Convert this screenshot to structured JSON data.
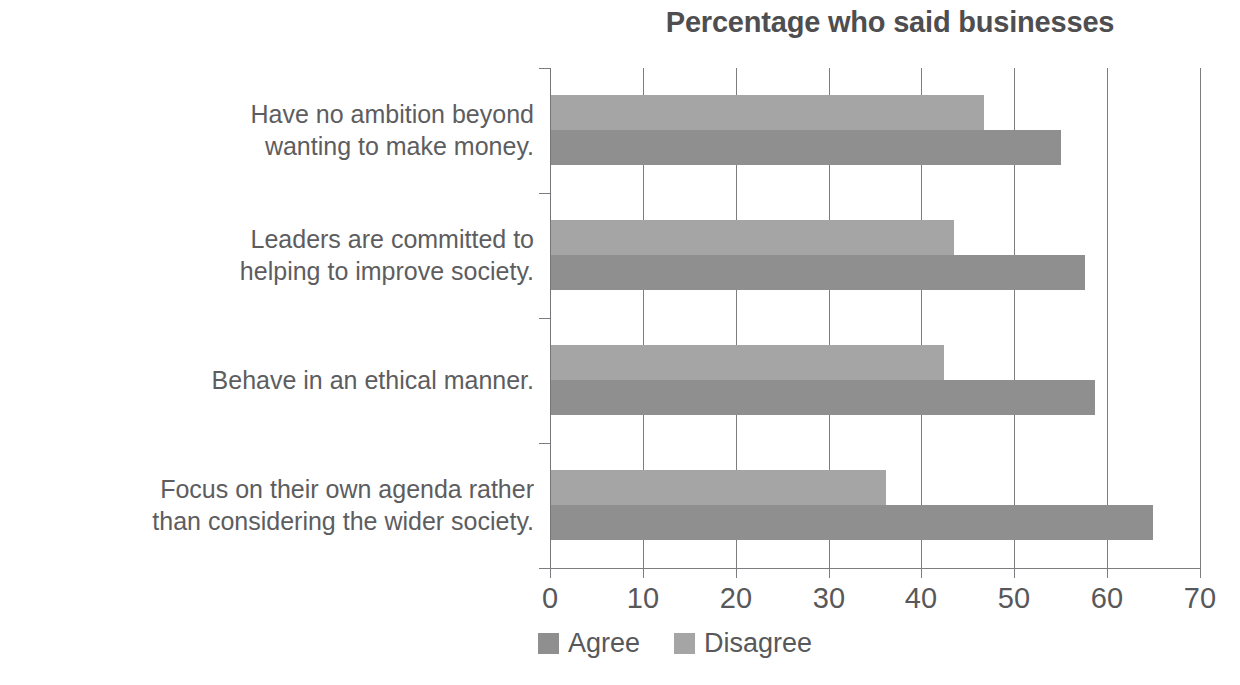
{
  "chart_data": {
    "type": "bar",
    "orientation": "horizontal",
    "title": "Percentage who said businesses",
    "xlabel": "",
    "ylabel": "",
    "xlim": [
      0,
      70
    ],
    "xticks": [
      0,
      10,
      20,
      30,
      40,
      50,
      60,
      70
    ],
    "grid": "vertical",
    "legend_position": "bottom",
    "categories": [
      "Have no ambition beyond wanting to make money.",
      "Leaders are committed to helping to improve society.",
      "Behave in an ethical manner.",
      "Focus on their own agenda rather than considering the wider society."
    ],
    "category_lines": [
      [
        "Have no ambition beyond",
        "wanting to make money."
      ],
      [
        "Leaders are committed to",
        "helping to improve society."
      ],
      [
        "Behave in an ethical manner."
      ],
      [
        "Focus on their own agenda rather",
        "than considering the wider society."
      ]
    ],
    "series": [
      {
        "name": "Agree",
        "color": "#8f8f8f",
        "values": [
          54.9,
          57.5,
          58.6,
          64.8
        ]
      },
      {
        "name": "Disagree",
        "color": "#a5a5a5",
        "values": [
          46.6,
          43.4,
          42.3,
          36.1
        ]
      }
    ]
  },
  "axis": {
    "tick_labels": [
      "0",
      "10",
      "20",
      "30",
      "40",
      "50",
      "60",
      "70"
    ]
  },
  "legend": {
    "items": [
      {
        "label": "Agree",
        "color": "#8f8f8f"
      },
      {
        "label": "Disagree",
        "color": "#a5a5a5"
      }
    ]
  }
}
